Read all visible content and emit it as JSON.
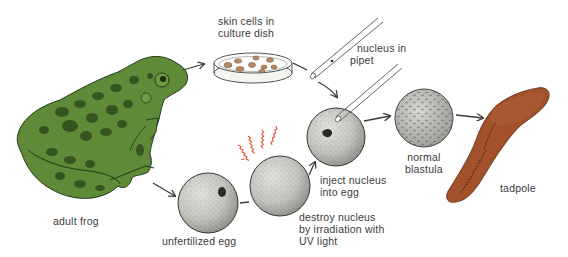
{
  "diagram": {
    "type": "process-flow",
    "topic": "nuclear transplantation / cloning of a frog",
    "colors": {
      "frog_body": "#5f8a37",
      "frog_spots": "#2f4a1c",
      "egg_fill": "#c9c9c4",
      "tadpole": "#a3512a",
      "uv_rays": "#e5533a",
      "arrow": "#3a3a3a",
      "text": "#3a3a3a"
    },
    "labels": {
      "skin_cells": [
        "skin cells in",
        "culture dish"
      ],
      "nucleus_pipet": [
        "nucleus in",
        "pipet"
      ],
      "adult_frog": "adult frog",
      "unfertilized_egg": "unfertilized egg",
      "destroy_nucleus": [
        "destroy nucleus",
        "by irradiation with",
        "UV light"
      ],
      "inject_nucleus": [
        "inject nucleus",
        "into egg"
      ],
      "normal_blastula": [
        "normal",
        "blastula"
      ],
      "tadpole": "tadpole"
    },
    "nodes": [
      {
        "id": "adult-frog",
        "label": "adult frog"
      },
      {
        "id": "culture-dish",
        "label": "skin cells in culture dish"
      },
      {
        "id": "pipet",
        "label": "nucleus in pipet"
      },
      {
        "id": "unfertilized-egg",
        "label": "unfertilized egg"
      },
      {
        "id": "irradiated-egg",
        "label": "destroy nucleus by irradiation with UV light"
      },
      {
        "id": "injected-egg",
        "label": "inject nucleus into egg"
      },
      {
        "id": "blastula",
        "label": "normal blastula"
      },
      {
        "id": "tadpole",
        "label": "tadpole"
      }
    ],
    "edges": [
      {
        "from": "adult-frog",
        "to": "culture-dish"
      },
      {
        "from": "culture-dish",
        "to": "pipet"
      },
      {
        "from": "pipet",
        "to": "injected-egg"
      },
      {
        "from": "adult-frog",
        "to": "unfertilized-egg"
      },
      {
        "from": "unfertilized-egg",
        "to": "irradiated-egg"
      },
      {
        "from": "irradiated-egg",
        "to": "injected-egg"
      },
      {
        "from": "injected-egg",
        "to": "blastula"
      },
      {
        "from": "blastula",
        "to": "tadpole"
      }
    ]
  }
}
